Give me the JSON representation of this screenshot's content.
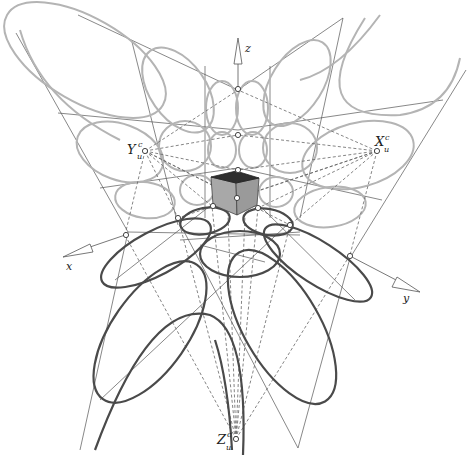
{
  "figure": {
    "axes": {
      "x": {
        "label": "x"
      },
      "y": {
        "label": "y"
      },
      "z": {
        "label": "z"
      }
    },
    "vanishing_points": {
      "X": {
        "base": "X",
        "sub": "u",
        "sup": "c"
      },
      "Y": {
        "base": "Y",
        "sub": "u",
        "sup": "c"
      },
      "Z": {
        "base": "Z",
        "sub": "u",
        "sup": "c"
      }
    },
    "colors": {
      "light_ellipses": "#b4b4b4",
      "dark_ellipses": "#4a4a4a",
      "cube_side": "#a8a8a8",
      "cube_top": "#2e2e2e",
      "lines": "#555555"
    }
  }
}
